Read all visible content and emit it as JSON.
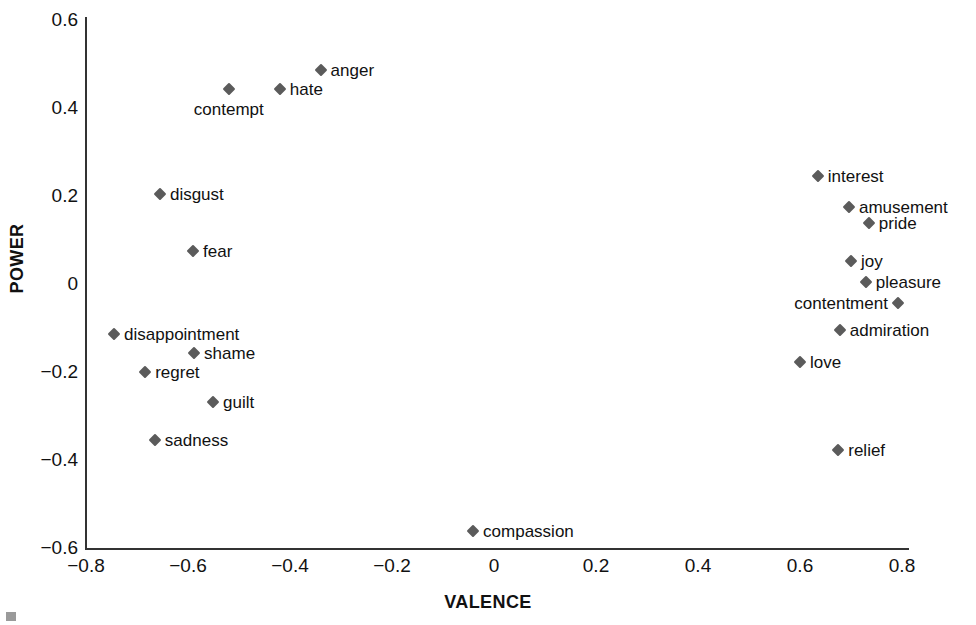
{
  "chart_data": {
    "type": "scatter",
    "title": "",
    "xlabel": "VALENCE",
    "ylabel": "POWER",
    "xlim": [
      -0.8,
      0.8
    ],
    "ylim": [
      -0.6,
      0.6
    ],
    "xticks": [
      "-0.8",
      "-0.6",
      "-0.4",
      "-0.2",
      "0",
      "0.2",
      "0.4",
      "0.6",
      "0.8"
    ],
    "xtick_values": [
      -0.8,
      -0.6,
      -0.4,
      -0.2,
      0,
      0.2,
      0.4,
      0.6,
      0.8
    ],
    "yticks": [
      "0.6",
      "0.4",
      "0.2",
      "0",
      "-0.2",
      "-0.4",
      "-0.6"
    ],
    "ytick_values": [
      0.6,
      0.4,
      0.2,
      0,
      -0.2,
      -0.4,
      -0.6
    ],
    "grid": false,
    "legend": false,
    "marker_color": "#5b5b5b",
    "marker_shape": "diamond",
    "axis_color": "#333333",
    "points": [
      {
        "label": "anger",
        "x": -0.34,
        "y": 0.484,
        "label_pos": "right"
      },
      {
        "label": "hate",
        "x": -0.42,
        "y": 0.441,
        "label_pos": "right"
      },
      {
        "label": "contempt",
        "x": -0.52,
        "y": 0.441,
        "label_pos": "below"
      },
      {
        "label": "interest",
        "x": 0.635,
        "y": 0.243,
        "label_pos": "right"
      },
      {
        "label": "disgust",
        "x": -0.655,
        "y": 0.202,
        "label_pos": "right"
      },
      {
        "label": "amusement",
        "x": 0.696,
        "y": 0.173,
        "label_pos": "right"
      },
      {
        "label": "pride",
        "x": 0.735,
        "y": 0.136,
        "label_pos": "right"
      },
      {
        "label": "fear",
        "x": -0.59,
        "y": 0.073,
        "label_pos": "right"
      },
      {
        "label": "joy",
        "x": 0.7,
        "y": 0.05,
        "label_pos": "right"
      },
      {
        "label": "pleasure",
        "x": 0.729,
        "y": 0.002,
        "label_pos": "right"
      },
      {
        "label": "contentment",
        "x": 0.792,
        "y": -0.045,
        "label_pos": "left"
      },
      {
        "label": "admiration",
        "x": 0.678,
        "y": -0.107,
        "label_pos": "right"
      },
      {
        "label": "disappointment",
        "x": -0.745,
        "y": -0.116,
        "label_pos": "right"
      },
      {
        "label": "shame",
        "x": -0.588,
        "y": -0.159,
        "label_pos": "right"
      },
      {
        "label": "regret",
        "x": -0.684,
        "y": -0.202,
        "label_pos": "right"
      },
      {
        "label": "love",
        "x": 0.6,
        "y": -0.18,
        "label_pos": "right"
      },
      {
        "label": "guilt",
        "x": -0.551,
        "y": -0.27,
        "label_pos": "right"
      },
      {
        "label": "sadness",
        "x": -0.665,
        "y": -0.357,
        "label_pos": "right"
      },
      {
        "label": "relief",
        "x": 0.675,
        "y": -0.379,
        "label_pos": "right"
      },
      {
        "label": "compassion",
        "x": -0.041,
        "y": -0.564,
        "label_pos": "right"
      }
    ]
  }
}
